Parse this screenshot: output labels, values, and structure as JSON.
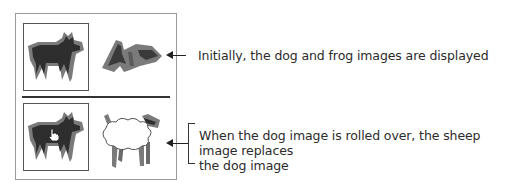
{
  "diagram": {
    "top_state": {
      "images": [
        {
          "name": "dog",
          "role": "rollover-target",
          "framed": true
        },
        {
          "name": "frog",
          "role": "static",
          "framed": false
        }
      ],
      "caption": "Initially, the dog and frog images are displayed"
    },
    "bottom_state": {
      "images": [
        {
          "name": "dog",
          "role": "rollover-target",
          "framed": true,
          "cursor": "hand-pointer"
        },
        {
          "name": "sheep",
          "role": "replacement",
          "framed": false
        }
      ],
      "caption_line1": "When the dog image is rolled over, the sheep image replaces",
      "caption_line2": "the dog image"
    },
    "colors": {
      "dark_fill": "#2e2e2e",
      "outline_gray": "#7a7a7a",
      "frame_border": "#9a9a9a",
      "text": "#2b2b2b"
    }
  }
}
